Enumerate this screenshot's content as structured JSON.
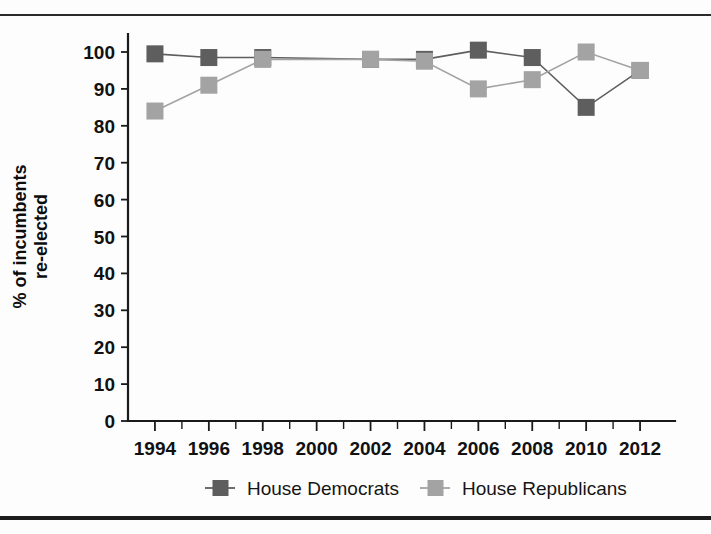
{
  "figure": {
    "background_color": "#fdfdfd",
    "rule_color": "#1f1f1f"
  },
  "chart_data": {
    "type": "line",
    "title": "",
    "subtitle": "",
    "xlabel": "",
    "ylabel": "% of incumbents re-elected",
    "ylabel_lines": [
      "% of incumbents",
      "re-elected"
    ],
    "x": [
      1994,
      1996,
      1998,
      2000,
      2002,
      2004,
      2006,
      2008,
      2010,
      2012
    ],
    "categories": [
      "1994",
      "1996",
      "1998",
      "2000",
      "2002",
      "2004",
      "2006",
      "2008",
      "2010",
      "2012"
    ],
    "xlim": [
      1993,
      2013
    ],
    "ylim": [
      0,
      100
    ],
    "yticks": [
      0,
      10,
      20,
      30,
      40,
      50,
      60,
      70,
      80,
      90,
      100
    ],
    "ytick_labels": [
      "0",
      "10",
      "20",
      "30",
      "40",
      "50",
      "60",
      "70",
      "80",
      "90",
      "100"
    ],
    "xticks": [
      1994,
      1995,
      1996,
      1997,
      1998,
      1999,
      2000,
      2001,
      2002,
      2003,
      2004,
      2005,
      2006,
      2007,
      2008,
      2009,
      2010,
      2011,
      2012
    ],
    "xtick_labels": [
      "1994",
      "",
      "1996",
      "",
      "1998",
      "",
      "2000",
      "",
      "2002",
      "",
      "2004",
      "",
      "2006",
      "",
      "2008",
      "",
      "2010",
      "",
      "2012"
    ],
    "grid": false,
    "legend_position": "below-axes",
    "marker": "square",
    "series": [
      {
        "name": "House Democrats",
        "color": "#5e5e5e",
        "values": [
          99.5,
          98.5,
          98.5,
          null,
          98.0,
          98.0,
          100.5,
          98.5,
          85.0,
          95.0
        ]
      },
      {
        "name": "House Republicans",
        "color": "#a3a3a3",
        "values": [
          84.0,
          91.0,
          98.0,
          null,
          98.0,
          97.5,
          90.0,
          92.5,
          100.0,
          95.0
        ]
      }
    ]
  },
  "legend": {
    "items": [
      {
        "label": "House Democrats",
        "color": "#5e5e5e"
      },
      {
        "label": "House Republicans",
        "color": "#a3a3a3"
      }
    ]
  }
}
